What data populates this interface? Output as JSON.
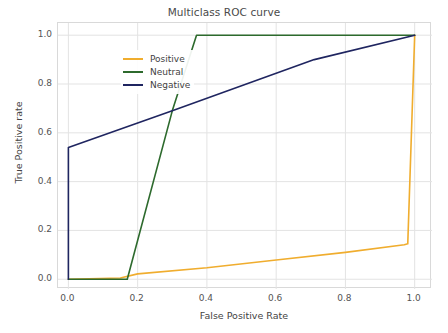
{
  "chart_data": {
    "type": "line",
    "title": "Multiclass ROC curve",
    "xlabel": "False Positive Rate",
    "ylabel": "True Positive rate",
    "xlim": [
      -0.03,
      1.05
    ],
    "ylim": [
      -0.04,
      1.05
    ],
    "xticks": [
      "0.0",
      "0.2",
      "0.4",
      "0.6",
      "0.8",
      "1.0"
    ],
    "xtick_values": [
      0.0,
      0.2,
      0.4,
      0.6,
      0.8,
      1.0
    ],
    "yticks": [
      "0.0",
      "0.2",
      "0.4",
      "0.6",
      "0.8",
      "1.0"
    ],
    "ytick_values": [
      0.0,
      0.2,
      0.4,
      0.6,
      0.8,
      1.0
    ],
    "grid": true,
    "legend_position": "upper left",
    "series": [
      {
        "name": "Positive",
        "color": "#f0ad2e",
        "x": [
          0.0,
          0.15,
          0.2,
          0.4,
          0.6,
          0.8,
          0.97,
          0.98,
          1.0
        ],
        "y": [
          0.0,
          0.005,
          0.022,
          0.047,
          0.079,
          0.11,
          0.141,
          0.145,
          1.0
        ]
      },
      {
        "name": "Neutral",
        "color": "#2d6a2d",
        "x": [
          0.0,
          0.17,
          0.3,
          0.37,
          1.0
        ],
        "y": [
          0.0,
          0.0,
          0.69,
          1.0,
          1.0
        ]
      },
      {
        "name": "Negative",
        "color": "#1f2560",
        "x": [
          0.0,
          0.0,
          0.3,
          0.71,
          1.0
        ],
        "y": [
          0.0,
          0.54,
          0.69,
          0.9,
          1.0
        ]
      }
    ]
  },
  "legend": {
    "items": [
      {
        "label": "Positive",
        "color": "#f0ad2e"
      },
      {
        "label": "Neutral",
        "color": "#2d6a2d"
      },
      {
        "label": "Negative",
        "color": "#1f2560"
      }
    ]
  },
  "style": {
    "grid_color": "#e3e3e3",
    "axis_color": "#d9d9d9",
    "background": "#ffffff",
    "text_color": "#4a4a4a"
  }
}
